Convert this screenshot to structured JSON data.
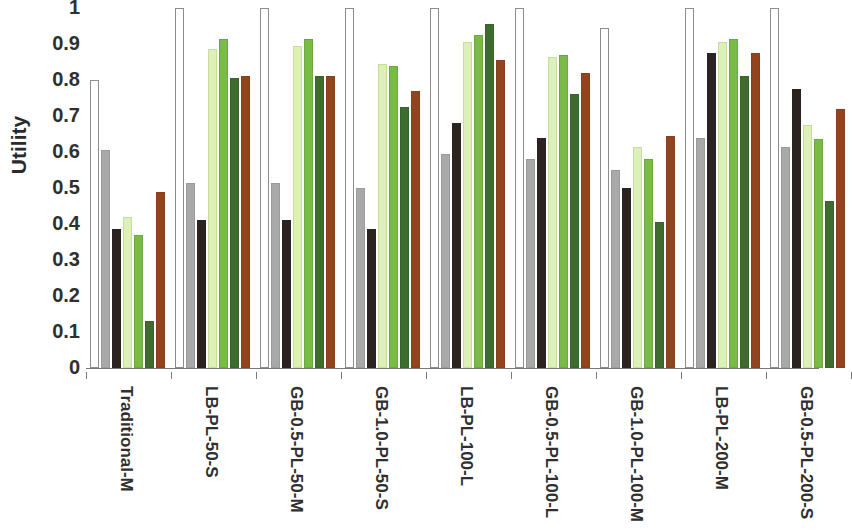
{
  "chart_data": {
    "type": "bar",
    "title": "",
    "subtitle": "",
    "xlabel": "",
    "ylabel": "Utility",
    "ylim": [
      0,
      1
    ],
    "y_ticks": [
      "1",
      "0.9",
      "0.8",
      "0.7",
      "0.6",
      "0.5",
      "0.4",
      "0.3",
      "0.2",
      "0.1",
      "0"
    ],
    "y_tick_values": [
      1,
      0.9,
      0.8,
      0.7,
      0.6,
      0.5,
      0.4,
      0.3,
      0.2,
      0.1,
      0
    ],
    "grid": false,
    "legend": "none",
    "legend_position": "none",
    "categories": [
      "Traditional-M",
      "LB-PL-50-S",
      "GB-0.5-PL-50-M",
      "GB-1.0-PL-50-S",
      "LB-PL-100-L",
      "GB-0.5-PL-100-L",
      "GB-1.0-PL-100-M",
      "LB-PL-200-M",
      "GB-0.5-PL-200-S"
    ],
    "series": [
      {
        "name": "series-1",
        "color": "#ffffff",
        "values": [
          0.8,
          1.0,
          1.0,
          1.0,
          1.0,
          1.0,
          0.945,
          1.0,
          1.0
        ]
      },
      {
        "name": "series-2",
        "color": "#a9a9a9",
        "values": [
          0.605,
          0.515,
          0.515,
          0.5,
          0.595,
          0.58,
          0.55,
          0.64,
          0.615
        ]
      },
      {
        "name": "series-3",
        "color": "#2b2320",
        "values": [
          0.385,
          0.41,
          0.41,
          0.385,
          0.68,
          0.64,
          0.5,
          0.875,
          0.775
        ]
      },
      {
        "name": "series-4",
        "color": "#ddf0b8",
        "values": [
          0.42,
          0.885,
          0.895,
          0.845,
          0.905,
          0.865,
          0.615,
          0.905,
          0.675
        ]
      },
      {
        "name": "series-5",
        "color": "#79bb46",
        "values": [
          0.37,
          0.915,
          0.915,
          0.84,
          0.925,
          0.87,
          0.58,
          0.915,
          0.635
        ]
      },
      {
        "name": "series-6",
        "color": "#3e6b2e",
        "values": [
          0.13,
          0.805,
          0.81,
          0.725,
          0.955,
          0.76,
          0.405,
          0.81,
          0.465
        ]
      },
      {
        "name": "series-7",
        "color": "#92441f",
        "values": [
          0.49,
          0.81,
          0.81,
          0.77,
          0.855,
          0.82,
          0.645,
          0.875,
          0.72
        ]
      }
    ]
  }
}
